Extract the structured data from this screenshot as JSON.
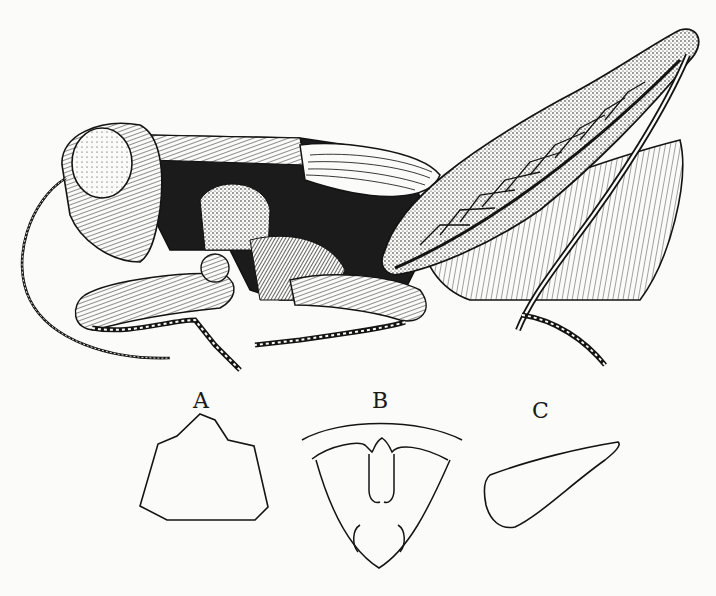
{
  "figure": {
    "labels": {
      "a": "A",
      "b": "B",
      "c": "C"
    },
    "colors": {
      "ink": "#141414",
      "paper": "#fbfbfa"
    }
  }
}
